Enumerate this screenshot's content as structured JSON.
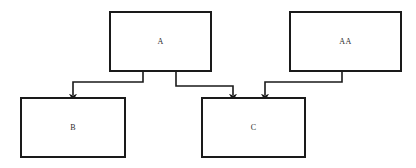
{
  "diagram": {
    "canvas": {
      "width": 416,
      "height": 168,
      "background": "#ffffff"
    },
    "style": {
      "node_border_color": "#1a1a1a",
      "node_border_width": 2,
      "node_fill": "#ffffff",
      "edge_color": "#1a1a1a",
      "edge_width": 1.6,
      "label_color": "#2b2b2b",
      "arrowhead": "filled-triangle"
    },
    "nodes": [
      {
        "id": "A",
        "label": "A",
        "x": 109,
        "y": 11,
        "width": 103,
        "height": 61
      },
      {
        "id": "AA",
        "label": "AA",
        "x": 289,
        "y": 11,
        "width": 113,
        "height": 61
      },
      {
        "id": "B",
        "label": "B",
        "x": 20,
        "y": 97,
        "width": 106,
        "height": 61
      },
      {
        "id": "C",
        "label": "C",
        "x": 201,
        "y": 97,
        "width": 105,
        "height": 61
      }
    ],
    "edges": [
      {
        "id": "edge-a-to-b",
        "from": "A",
        "to": "B",
        "label": "",
        "routing": "orthogonal",
        "points": "143,72 143,82 73,82 73,95"
      },
      {
        "id": "edge-a-to-c",
        "from": "A",
        "to": "C",
        "label": "",
        "routing": "orthogonal",
        "points": "176,72 176,86 233,86 233,95"
      },
      {
        "id": "edge-aa-to-c",
        "from": "AA",
        "to": "C",
        "label": "",
        "routing": "orthogonal",
        "points": "342,72 342,82 265,82 265,95"
      }
    ]
  }
}
